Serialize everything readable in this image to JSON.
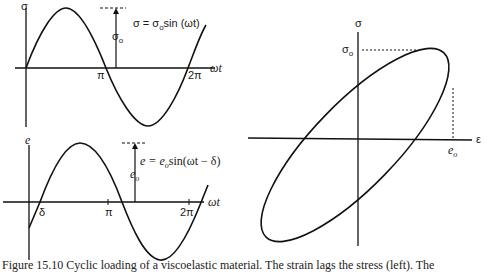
{
  "figure": {
    "caption": "Figure 15.10  Cyclic loading of a viscoelastic material. The strain lags the stress (left). The",
    "stress_plot": {
      "y_axis_label": "σ",
      "x_axis_label": "ωt",
      "ticks": [
        "π",
        "2π"
      ],
      "amplitude_label": "σ",
      "amplitude_sub": "o",
      "equation": "σ = σ",
      "equation_sub": "o",
      "equation_rest": "sin (ωt)"
    },
    "strain_plot": {
      "y_axis_label": "e",
      "x_axis_label": "ωt",
      "ticks": [
        "δ",
        "π",
        "2π"
      ],
      "amplitude_label": "e",
      "amplitude_sub": "o",
      "equation": "e = e",
      "equation_sub": "o",
      "equation_rest": "sin(ωt − δ)"
    },
    "hysteresis_plot": {
      "y_axis_label": "σ",
      "x_axis_label": "ε",
      "y_max_label": "σ",
      "y_max_sub": "o",
      "x_max_label": "e",
      "x_max_sub": "o"
    }
  }
}
